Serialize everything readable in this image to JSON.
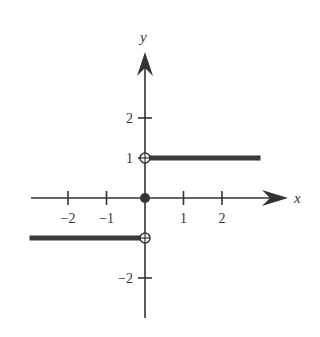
{
  "chart_data": {
    "type": "line",
    "title": "",
    "xlabel": "x",
    "ylabel": "y",
    "xlim": [
      -3,
      3.7
    ],
    "ylim": [
      -3,
      3.7
    ],
    "x_ticks": [
      -2,
      -1,
      1,
      2
    ],
    "x_tick_labels": [
      "−2",
      "−1",
      "1",
      "2"
    ],
    "y_ticks": [
      2,
      1,
      -2
    ],
    "y_tick_labels": [
      "2",
      "1",
      "−2"
    ],
    "grid": false,
    "series": [
      {
        "name": "f(x) = -1 for x < 0",
        "x": [
          -3,
          0
        ],
        "y": [
          -1,
          -1
        ]
      },
      {
        "name": "f(x) = 1 for x > 0",
        "x": [
          0,
          3
        ],
        "y": [
          1,
          1
        ]
      }
    ],
    "points": [
      {
        "name": "open-circle-upper",
        "x": 0,
        "y": 1,
        "filled": false
      },
      {
        "name": "filled-point-origin",
        "x": 0,
        "y": 0,
        "filled": true
      },
      {
        "name": "open-circle-lower",
        "x": 0,
        "y": -1,
        "filled": false
      }
    ],
    "colors": {
      "ink": "#333333",
      "segment": "#3a3a3a"
    }
  }
}
